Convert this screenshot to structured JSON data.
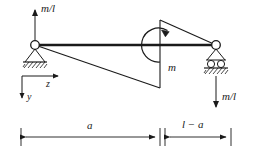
{
  "figure": {
    "type": "engineering-beam-diagram",
    "colors": {
      "line": "#1a1a1a",
      "background": "#ffffff"
    },
    "labels": {
      "reaction_left": "m/l",
      "reaction_right": "m/l",
      "moment": "m",
      "axis_z": "z",
      "axis_y": "y",
      "dim_left": "a",
      "dim_right": "l − a"
    },
    "geometry": {
      "beam_left_x": 35,
      "beam_right_x": 216,
      "beam_y": 45,
      "moment_x": 160,
      "diagram_peak_top_y": 20,
      "diagram_peak_bottom_y": 88,
      "dimension_line_y": 137,
      "axis_origin_x": 22,
      "axis_origin_y": 76
    },
    "icons": {
      "pin_support": "pin-support-icon",
      "roller_support": "roller-support-icon",
      "hatching": "ground-hatching-icon",
      "moment_arc": "moment-arc-icon",
      "arrow_up": "force-arrow-up-icon",
      "arrow_down": "force-arrow-down-icon"
    }
  }
}
